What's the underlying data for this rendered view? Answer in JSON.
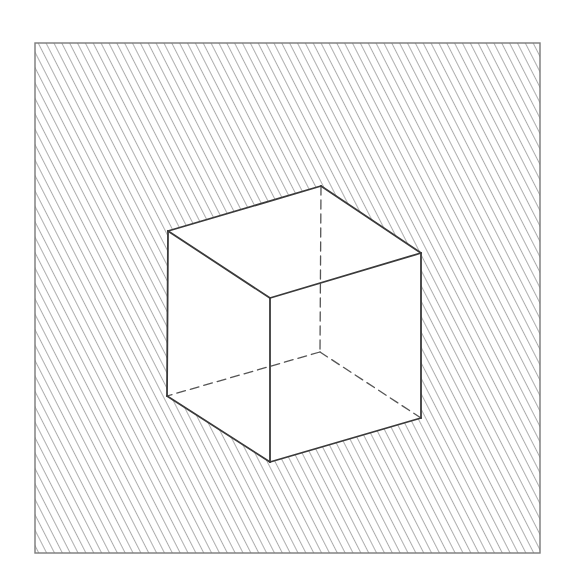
{
  "figure": {
    "colors": {
      "background": "#ffffff",
      "hatch": "#8a8a8a",
      "frame": "#7a7a7a",
      "cube_edge": "#3a3a3a",
      "hidden_edge": "#555555",
      "cube_fill": "#ffffff"
    },
    "frame": {
      "x": 35,
      "y": 43,
      "width": 505,
      "height": 510
    },
    "hatch": {
      "spacing": 7,
      "angle_deg": 63,
      "stroke_width": 1.4
    },
    "cube": {
      "vertices": {
        "top_left": [
          168,
          231
        ],
        "top_back": [
          321,
          186
        ],
        "top_right": [
          421,
          253
        ],
        "top_front": [
          270,
          298
        ],
        "bottom_left": [
          167,
          396
        ],
        "bottom_back": [
          320,
          352
        ],
        "bottom_right": [
          421,
          418
        ],
        "bottom_front": [
          270,
          462
        ]
      },
      "visible_edges": [
        [
          "top_left",
          "top_back"
        ],
        [
          "top_back",
          "top_right"
        ],
        [
          "top_right",
          "top_front"
        ],
        [
          "top_front",
          "top_left"
        ],
        [
          "top_left",
          "bottom_left"
        ],
        [
          "top_front",
          "bottom_front"
        ],
        [
          "top_right",
          "bottom_right"
        ],
        [
          "bottom_left",
          "bottom_front"
        ],
        [
          "bottom_front",
          "bottom_right"
        ]
      ],
      "hidden_edges": [
        [
          "top_back",
          "bottom_back"
        ],
        [
          "bottom_back",
          "bottom_left"
        ],
        [
          "bottom_back",
          "bottom_right"
        ]
      ]
    }
  }
}
